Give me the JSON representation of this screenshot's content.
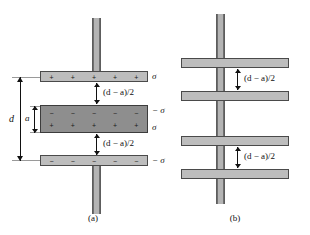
{
  "figure": {
    "background_color": "#ffffff",
    "plate_fill": "#bdbdbd",
    "slab_fill": "#8e8e8e",
    "stem_fill": "#b4b4b4",
    "outline_color": "#4a4a4a"
  },
  "panel_a": {
    "caption": "(a)",
    "top_plate": {
      "charge_symbol": "+",
      "charge_count": 5,
      "sigma_label": "σ"
    },
    "slab": {
      "top_charge_symbol": "−",
      "top_charge_count": 5,
      "top_sigma_label": "− σ",
      "bottom_charge_symbol": "+",
      "bottom_charge_count": 5,
      "bottom_sigma_label": "σ"
    },
    "bottom_plate": {
      "charge_symbol": "−",
      "charge_count": 5,
      "sigma_label": "− σ"
    },
    "gap_label_top": "(d − a)/2",
    "gap_label_bottom": "(d − a)/2",
    "dimension_d": "d",
    "dimension_a": "a"
  },
  "panel_b": {
    "caption": "(b)",
    "gap_label_upper": "(d − a)/2",
    "gap_label_lower": "(d − a)/2",
    "plate_count": 4
  }
}
